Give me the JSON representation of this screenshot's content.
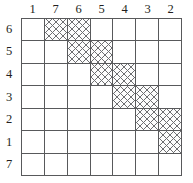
{
  "figure": {
    "kind": "block-diagonal-matrix-grid",
    "grid_size": "7x7",
    "line_color": "#58595b",
    "hatch_color": "#6d6e71",
    "cell_background": "#ffffff"
  },
  "column_headers": [
    {
      "label": "1"
    },
    {
      "label": "7"
    },
    {
      "label": "6"
    },
    {
      "label": "5"
    },
    {
      "label": "4"
    },
    {
      "label": "3"
    },
    {
      "label": "2"
    }
  ],
  "row_headers": [
    {
      "label": "6"
    },
    {
      "label": "5"
    },
    {
      "label": "4"
    },
    {
      "label": "3"
    },
    {
      "label": "2"
    },
    {
      "label": "1"
    },
    {
      "label": "7"
    }
  ],
  "chart_data": {
    "type": "heatmap",
    "title": "",
    "xlabel": "",
    "ylabel": "",
    "categories": [
      "1",
      "7",
      "6",
      "5",
      "4",
      "3",
      "2"
    ],
    "row_categories": [
      "6",
      "5",
      "4",
      "3",
      "2",
      "1",
      "7"
    ],
    "legend": [],
    "grid": true,
    "value_meaning": {
      "1": "shaded (cross-hatched)",
      "0": "empty"
    },
    "values": [
      [
        0,
        1,
        1,
        0,
        0,
        0,
        0
      ],
      [
        0,
        0,
        1,
        1,
        0,
        0,
        0
      ],
      [
        0,
        0,
        0,
        1,
        1,
        0,
        0
      ],
      [
        0,
        0,
        0,
        0,
        1,
        1,
        0
      ],
      [
        0,
        0,
        0,
        0,
        0,
        1,
        1
      ],
      [
        0,
        0,
        0,
        0,
        0,
        0,
        1
      ],
      [
        0,
        0,
        0,
        0,
        0,
        0,
        0
      ]
    ],
    "shaded_cells": [
      {
        "row": "6",
        "col": "7"
      },
      {
        "row": "6",
        "col": "6"
      },
      {
        "row": "5",
        "col": "6"
      },
      {
        "row": "5",
        "col": "5"
      },
      {
        "row": "4",
        "col": "5"
      },
      {
        "row": "4",
        "col": "4"
      },
      {
        "row": "3",
        "col": "4"
      },
      {
        "row": "3",
        "col": "3"
      },
      {
        "row": "2",
        "col": "3"
      },
      {
        "row": "2",
        "col": "2"
      },
      {
        "row": "1",
        "col": "2"
      }
    ]
  }
}
